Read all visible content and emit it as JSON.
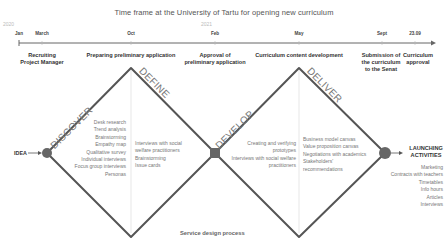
{
  "title": "Time frame at the University of Tartu for opening new curriculum",
  "timeline": {
    "years": [
      {
        "label": "2020",
        "x": 10
      },
      {
        "label": "2021",
        "x": 206
      }
    ],
    "months": [
      {
        "label": "Jan",
        "x": 19
      },
      {
        "label": "March",
        "x": 42
      },
      {
        "label": "Oct",
        "x": 131
      },
      {
        "label": "Feb",
        "x": 215
      },
      {
        "label": "May",
        "x": 299
      },
      {
        "label": "Sept",
        "x": 382
      },
      {
        "label": "23.09",
        "x": 415
      }
    ]
  },
  "phases": [
    {
      "label": "Recruiting\nProject Manager",
      "x": 42
    },
    {
      "label": "Preparing preliminary application",
      "x": 131
    },
    {
      "label": "Approval of\npreliminary application",
      "x": 215
    },
    {
      "label": "Curriculum content development",
      "x": 299
    },
    {
      "label": "Submission of\nthe curriculum\nto the Senat",
      "x": 381
    },
    {
      "label": "Curriculum\napproval",
      "x": 418
    }
  ],
  "stages": {
    "discover": "DISCOVER",
    "define": "DEFINE",
    "develop": "DEVELOP",
    "deliver": "DELIVER"
  },
  "idea_label": "IDEA",
  "lists": {
    "discover": [
      "Desk research",
      "Trend analysis",
      "Brainstorming",
      "Empathy map",
      "Qualitative survey",
      "Individual interviews",
      "Focus group interviews",
      "Personas"
    ],
    "define": [
      "Interviews with social",
      "welfare practitioners",
      "Brainstorming",
      "Issue cards"
    ],
    "develop": [
      "Creating and verifying",
      "prototypes",
      "Interviews with social welfare",
      "practitioners"
    ],
    "deliver": [
      "Business model canvas",
      "Value proposition canvas",
      "Negotiations with academics",
      "Stakeholders'",
      "recommendations"
    ]
  },
  "launching": {
    "title_line1": "LAUNCHING",
    "title_line2": "ACTIVITIES",
    "items": [
      "Marketing",
      "Contracts with teachers",
      "Timetables",
      "Info hours",
      "Articles",
      "Interviews"
    ]
  },
  "footer": "Service design process",
  "colors": {
    "line": "#555555",
    "node": "#666666",
    "divider": "#dddddd",
    "timeline": "#666666"
  }
}
